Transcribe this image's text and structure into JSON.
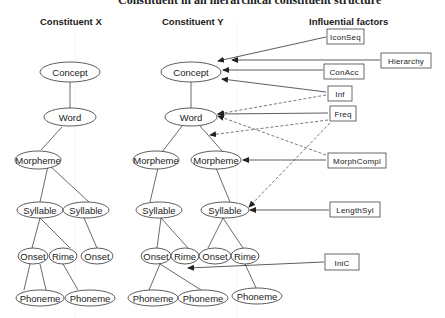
{
  "title_cut": "Constituent in an hierarchical constituent structure",
  "headers": {
    "x": "Constituent X",
    "y": "Constituent Y",
    "factors": "Influential factors"
  },
  "tree_x": {
    "concept": "Concept",
    "word": "Word",
    "morpheme": "Morpheme",
    "syllable1": "Syllable",
    "syllable2": "Syllable",
    "onset1": "Onset",
    "rime1": "Rime",
    "onset2": "Onset",
    "phoneme1": "Phoneme",
    "phoneme2": "Phoneme"
  },
  "tree_y": {
    "concept": "Concept",
    "word": "Word",
    "morpheme1": "Morpheme",
    "morpheme2": "Morpheme",
    "syllable1": "Syllable",
    "syllable2": "Syllable",
    "onset1": "Onset",
    "rime1": "Rime",
    "onset2": "Onset",
    "rime2": "Rime",
    "phoneme1": "Phoneme",
    "phoneme2": "Phoneme",
    "phoneme3": "Phoneme"
  },
  "factors": [
    {
      "id": "iconseq",
      "label": "IconSeq",
      "target": "Concept",
      "style": "solid"
    },
    {
      "id": "hierarchy",
      "label": "Hierarchy",
      "target": "Concept",
      "style": "solid"
    },
    {
      "id": "conacc",
      "label": "ConAcc",
      "target": "Concept",
      "style": "solid"
    },
    {
      "id": "inf",
      "label": "Inf",
      "targets": [
        "Concept",
        "Word"
      ],
      "style": "solid+dashed"
    },
    {
      "id": "freq",
      "label": "Freq",
      "targets": [
        "Word",
        "Morpheme-Word link",
        "Syllable"
      ],
      "style": "solid+dashed"
    },
    {
      "id": "morphcompl",
      "label": "MorphCompl",
      "targets": [
        "Morpheme",
        "Word"
      ],
      "style": "solid+dashed"
    },
    {
      "id": "lengthsyl",
      "label": "LengthSyl",
      "target": "Syllable",
      "style": "solid"
    },
    {
      "id": "inic",
      "label": "IniC",
      "target": "Onset-Phoneme link",
      "style": "solid"
    }
  ]
}
